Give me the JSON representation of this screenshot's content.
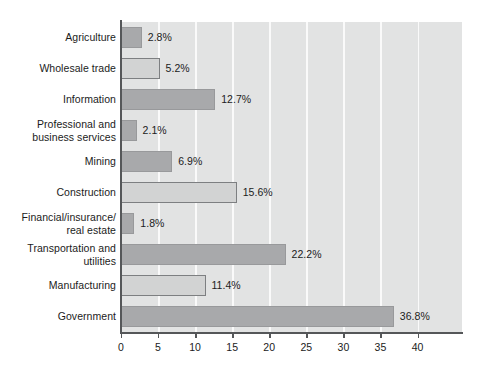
{
  "chart_data": {
    "type": "bar",
    "orientation": "horizontal",
    "title": "",
    "subtitle": "",
    "xlabel": "",
    "ylabel": "",
    "xlim": [
      0,
      46
    ],
    "ylim": null,
    "grid": true,
    "legend": null,
    "legend_position": "none",
    "axis_ticks": [
      0,
      5,
      10,
      15,
      20,
      25,
      30,
      35,
      40
    ],
    "axis_tick_labels": [
      "0",
      "5",
      "10",
      "15",
      "20",
      "25",
      "30",
      "35",
      "40"
    ],
    "categories": [
      "Agriculture",
      "Wholesale trade",
      "Information",
      "Professional and\nbusiness services",
      "Mining",
      "Construction",
      "Financial/insurance/\nreal estate",
      "Transportation and\nutilities",
      "Manufacturing",
      "Government"
    ],
    "values": [
      2.8,
      5.2,
      12.7,
      2.1,
      6.9,
      15.6,
      1.8,
      22.2,
      11.4,
      36.8
    ],
    "value_labels": [
      "2.8%",
      "5.2%",
      "12.7%",
      "2.1%",
      "6.9%",
      "15.6%",
      "1.8%",
      "22.2%",
      "11.4%",
      "36.8%"
    ],
    "bar_styles": [
      "dark",
      "light",
      "dark",
      "dark",
      "dark",
      "light",
      "dark",
      "dark",
      "light",
      "dark"
    ],
    "colors": {
      "plot_background": "#e2e3e3",
      "gridline": "#fafafa",
      "axis": "#555759",
      "bar_dark": "#a8a9ab",
      "bar_light": "#d2d3d3",
      "bar_light_border": "#7d7f81",
      "text": "#1b1b1b",
      "page_background": "#ffffff"
    }
  }
}
